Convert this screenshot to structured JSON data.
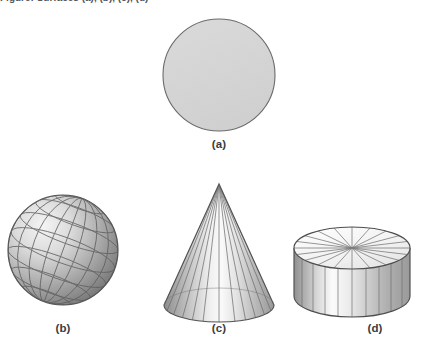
{
  "figure": {
    "background_color": "#ffffff",
    "truncated_caption_top": "Figure: Surfaces (a), (b), (c), (d)",
    "panels": [
      {
        "id": "a",
        "label": "(a)",
        "shape": "disk",
        "description": "flat shaded circular disk",
        "fill_color": "#d4d4d4",
        "stroke_color": "#6a6a6a",
        "center_x": 219,
        "center_y": 75,
        "radius": 56,
        "label_x": 219,
        "label_y": 145
      },
      {
        "id": "b",
        "label": "(b)",
        "shape": "sphere",
        "description": "shaded sphere with latitude and longitude grid lines",
        "fill_light": "#f2f2f2",
        "fill_dark": "#7d7d7d",
        "stroke_color": "#5a5a5a",
        "grid_color": "#5f5f5f",
        "center_x": 63,
        "center_y": 250,
        "radius": 55,
        "meridians": 6,
        "parallels": 6,
        "tilt_degrees": 22,
        "label_x": 63,
        "label_y": 330
      },
      {
        "id": "c",
        "label": "(c)",
        "shape": "cone",
        "description": "shaded cone with radial ruling lines from apex to elliptical base",
        "fill_light": "#fafafa",
        "fill_dark": "#8a8a8a",
        "stroke_color": "#5a5a5a",
        "grid_color": "#6b6b6b",
        "apex_x": 219,
        "apex_y": 184,
        "base_center_x": 219,
        "base_center_y": 305,
        "base_rx": 55,
        "base_ry": 17,
        "ruling_lines": 12,
        "label_x": 219,
        "label_y": 330
      },
      {
        "id": "d",
        "label": "(d)",
        "shape": "cylinder",
        "description": "shaded cylinder with radial spokes on top face and vertical ruling lines on side",
        "fill_light": "#fbfbfb",
        "fill_dark": "#8e8e8e",
        "top_fill": "#f4f4f4",
        "stroke_color": "#4e4e4e",
        "grid_color": "#6e6e6e",
        "top_center_x": 352,
        "top_center_y": 248,
        "top_rx": 58,
        "top_ry": 21,
        "height": 48,
        "spokes": 20,
        "side_lines": 10,
        "label_x": 352,
        "label_y": 330
      }
    ]
  }
}
